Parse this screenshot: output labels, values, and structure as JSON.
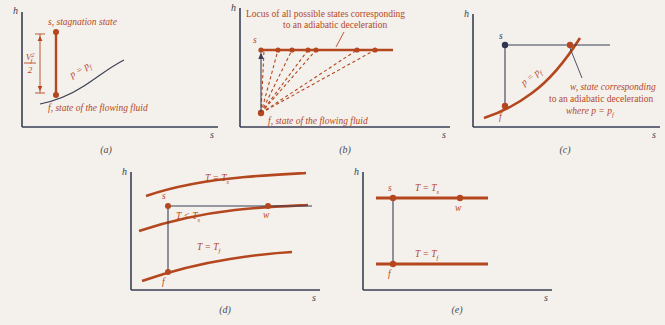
{
  "figure": {
    "background_color": "#f4f1ec",
    "axis_color": "#3a3f55",
    "curve_color": "#b5471f",
    "dark_point_color": "#2f3550",
    "axis_labels": {
      "y": "h",
      "x": "s"
    }
  },
  "panels": [
    {
      "id": "a",
      "caption": "(a)",
      "ylabel": "h",
      "xlabel": "s",
      "annotations": [
        {
          "name": "stagnation-state-label",
          "text": "s, stagnation state"
        },
        {
          "name": "flowing-fluid-label",
          "text": "f, state of the flowing fluid"
        },
        {
          "name": "pressure-curve-label",
          "text": "p = p",
          "sub": "f"
        },
        {
          "name": "kinetic-energy-label",
          "numerator": "V",
          "numerator_sup": "2",
          "numerator_sub": "f",
          "denominator": "2"
        }
      ],
      "points": [
        {
          "name": "point-s",
          "label": "s",
          "color": "#b5471f"
        },
        {
          "name": "point-f",
          "label": "f",
          "color": "#b5471f"
        }
      ]
    },
    {
      "id": "b",
      "caption": "(b)",
      "ylabel": "h",
      "xlabel": "s",
      "annotations": [
        {
          "name": "locus-label-line1",
          "text": "Locus of all possible states corresponding"
        },
        {
          "name": "locus-label-line2",
          "text": "to an adiabatic deceleration"
        },
        {
          "name": "flowing-fluid-label",
          "text": "f, state of the flowing fluid"
        },
        {
          "name": "stagnation-point-label",
          "text": "s"
        }
      ],
      "ray_count": 7
    },
    {
      "id": "c",
      "caption": "(c)",
      "ylabel": "h",
      "xlabel": "s",
      "annotations": [
        {
          "name": "pressure-curve-label",
          "text": "p = p",
          "sub": "f"
        },
        {
          "name": "w-state-line1",
          "text": "w, state corresponding"
        },
        {
          "name": "w-state-line2",
          "text": "to an adiabatic deceleration"
        },
        {
          "name": "w-state-line3",
          "text": "where p = p",
          "sub": "f"
        }
      ],
      "points": [
        {
          "name": "point-s",
          "label": "s",
          "color": "#2f3550"
        },
        {
          "name": "point-f",
          "label": "f",
          "color": "#b5471f"
        },
        {
          "name": "point-w",
          "label": "w",
          "color": "#b5471f"
        }
      ]
    },
    {
      "id": "d",
      "caption": "(d)",
      "ylabel": "h",
      "xlabel": "s",
      "isotherms": [
        {
          "name": "isotherm-top",
          "text": "T = T",
          "sub": "s"
        },
        {
          "name": "isotherm-middle",
          "text": "T < T",
          "sub": "s"
        },
        {
          "name": "isotherm-bottom",
          "text": "T = T",
          "sub": "f"
        }
      ],
      "points": [
        {
          "name": "point-s",
          "label": "s",
          "color": "#b5471f"
        },
        {
          "name": "point-f",
          "label": "f",
          "color": "#b5471f"
        },
        {
          "name": "point-w",
          "label": "w",
          "color": "#b5471f"
        }
      ]
    },
    {
      "id": "e",
      "caption": "(e)",
      "ylabel": "h",
      "xlabel": "s",
      "isotherms": [
        {
          "name": "isotherm-top",
          "text": "T = T",
          "sub": "s"
        },
        {
          "name": "isotherm-bottom",
          "text": "T = T",
          "sub": "f"
        }
      ],
      "points": [
        {
          "name": "point-s",
          "label": "s",
          "color": "#b5471f"
        },
        {
          "name": "point-f",
          "label": "f",
          "color": "#b5471f"
        },
        {
          "name": "point-w",
          "label": "w",
          "color": "#b5471f"
        }
      ]
    }
  ]
}
